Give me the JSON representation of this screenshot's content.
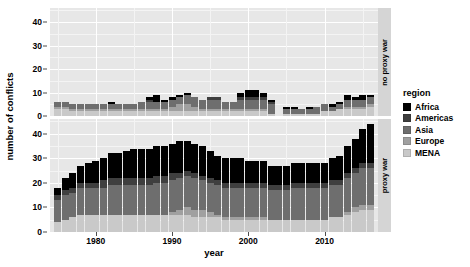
{
  "chart_data": {
    "type": "bar",
    "stacked": true,
    "title": "",
    "xlabel": "year",
    "ylabel": "number of conflicts",
    "xlim": [
      1974,
      2017
    ],
    "ylim": [
      0,
      46
    ],
    "yticks": [
      0,
      10,
      20,
      30,
      40
    ],
    "xticks": [
      1980,
      1990,
      2000,
      2010
    ],
    "grid": true,
    "legend_position": "right",
    "legend_title": "region",
    "facet_labels": [
      "no proxy war",
      "proxy war"
    ],
    "series_names": [
      "Africa",
      "Americas",
      "Asia",
      "Europe",
      "MENA"
    ],
    "series_colors": [
      "#000000",
      "#3f3f3f",
      "#6e6e6e",
      "#a0a0a0",
      "#c9c9c9"
    ],
    "panels": [
      {
        "label": "no proxy war",
        "years": [
          1975,
          1976,
          1977,
          1978,
          1979,
          1980,
          1981,
          1982,
          1983,
          1984,
          1985,
          1986,
          1987,
          1988,
          1989,
          1990,
          1991,
          1992,
          1993,
          1994,
          1995,
          1996,
          1997,
          1998,
          1999,
          2000,
          2001,
          2002,
          2003,
          2004,
          2005,
          2006,
          2007,
          2008,
          2009,
          2010,
          2011,
          2012,
          2013,
          2014,
          2015,
          2016
        ],
        "series": [
          {
            "name": "Africa",
            "values": [
              0,
              0,
              0,
              0,
              0,
              0,
              0,
              1,
              0,
              0,
              0,
              0,
              1,
              3,
              1,
              1,
              1,
              1,
              0,
              0,
              0,
              0,
              0,
              0,
              2,
              3,
              3,
              2,
              1,
              0,
              1,
              1,
              0,
              1,
              0,
              0,
              1,
              1,
              2,
              1,
              2,
              1
            ]
          },
          {
            "name": "Americas",
            "values": [
              0,
              0,
              0,
              0,
              0,
              0,
              0,
              0,
              0,
              0,
              0,
              0,
              1,
              0,
              0,
              0,
              0,
              0,
              0,
              0,
              1,
              1,
              0,
              0,
              1,
              1,
              1,
              1,
              1,
              0,
              0,
              0,
              0,
              0,
              0,
              0,
              0,
              0,
              0,
              0,
              0,
              0
            ]
          },
          {
            "name": "Asia",
            "values": [
              2,
              2,
              2,
              2,
              2,
              2,
              2,
              2,
              2,
              2,
              2,
              3,
              3,
              3,
              3,
              3,
              3,
              4,
              4,
              4,
              4,
              4,
              3,
              3,
              4,
              4,
              4,
              4,
              4,
              0,
              2,
              2,
              2,
              2,
              3,
              3,
              2,
              2,
              3,
              3,
              3,
              3
            ]
          },
          {
            "name": "Europe",
            "values": [
              1,
              1,
              1,
              1,
              1,
              1,
              1,
              1,
              1,
              1,
              1,
              1,
              1,
              1,
              1,
              2,
              3,
              3,
              2,
              1,
              1,
              1,
              1,
              1,
              1,
              1,
              1,
              1,
              0,
              0,
              0,
              0,
              0,
              0,
              0,
              0,
              0,
              0,
              1,
              1,
              1,
              1
            ]
          },
          {
            "name": "MENA",
            "values": [
              3,
              3,
              2,
              2,
              2,
              2,
              2,
              2,
              2,
              2,
              2,
              2,
              2,
              2,
              2,
              2,
              2,
              2,
              2,
              2,
              2,
              2,
              2,
              2,
              2,
              2,
              2,
              2,
              1,
              0,
              1,
              1,
              1,
              1,
              1,
              2,
              2,
              3,
              3,
              3,
              3,
              4
            ]
          }
        ],
        "totals": [
          6,
          6,
          5,
          5,
          5,
          5,
          5,
          6,
          5,
          5,
          5,
          6,
          8,
          9,
          7,
          8,
          9,
          10,
          8,
          7,
          8,
          8,
          6,
          6,
          10,
          11,
          11,
          10,
          7,
          0,
          4,
          4,
          3,
          4,
          4,
          5,
          5,
          6,
          9,
          8,
          9,
          9
        ]
      },
      {
        "label": "proxy war",
        "years": [
          1975,
          1976,
          1977,
          1978,
          1979,
          1980,
          1981,
          1982,
          1983,
          1984,
          1985,
          1986,
          1987,
          1988,
          1989,
          1990,
          1991,
          1992,
          1993,
          1994,
          1995,
          1996,
          1997,
          1998,
          1999,
          2000,
          2001,
          2002,
          2003,
          2004,
          2005,
          2006,
          2007,
          2008,
          2009,
          2010,
          2011,
          2012,
          2013,
          2014,
          2015,
          2016
        ],
        "series": [
          {
            "name": "Africa",
            "values": [
              3,
              5,
              6,
              7,
              8,
              9,
              9,
              10,
              10,
              11,
              12,
              12,
              12,
              12,
              12,
              12,
              13,
              12,
              12,
              12,
              11,
              10,
              10,
              10,
              10,
              9,
              9,
              9,
              8,
              8,
              8,
              8,
              8,
              8,
              8,
              8,
              9,
              10,
              11,
              12,
              14,
              16
            ]
          },
          {
            "name": "Americas",
            "values": [
              2,
              2,
              2,
              2,
              2,
              2,
              3,
              3,
              3,
              3,
              3,
              3,
              3,
              3,
              3,
              3,
              2,
              2,
              2,
              2,
              2,
              2,
              2,
              2,
              2,
              2,
              2,
              2,
              2,
              2,
              2,
              2,
              2,
              2,
              2,
              2,
              2,
              2,
              2,
              2,
              2,
              2
            ]
          },
          {
            "name": "Asia",
            "values": [
              9,
              10,
              10,
              11,
              11,
              11,
              11,
              12,
              12,
              12,
              12,
              12,
              12,
              13,
              13,
              13,
              13,
              13,
              13,
              12,
              12,
              12,
              12,
              12,
              12,
              12,
              12,
              12,
              12,
              12,
              12,
              13,
              13,
              13,
              13,
              13,
              13,
              13,
              14,
              14,
              15,
              15
            ]
          },
          {
            "name": "Europe",
            "values": [
              0,
              0,
              0,
              0,
              0,
              0,
              0,
              0,
              0,
              0,
              0,
              0,
              0,
              0,
              0,
              1,
              2,
              3,
              3,
              3,
              2,
              1,
              1,
              1,
              1,
              1,
              1,
              1,
              0,
              0,
              0,
              0,
              0,
              0,
              0,
              0,
              0,
              0,
              1,
              2,
              2,
              2
            ]
          },
          {
            "name": "MENA",
            "values": [
              4,
              5,
              6,
              7,
              7,
              7,
              7,
              7,
              7,
              7,
              7,
              7,
              7,
              7,
              7,
              7,
              7,
              7,
              6,
              6,
              6,
              6,
              5,
              5,
              5,
              5,
              5,
              5,
              5,
              5,
              5,
              5,
              5,
              5,
              5,
              5,
              6,
              6,
              7,
              8,
              9,
              9
            ]
          }
        ],
        "totals": [
          18,
          22,
          24,
          27,
          28,
          29,
          30,
          32,
          32,
          33,
          34,
          34,
          34,
          35,
          35,
          36,
          37,
          37,
          36,
          35,
          33,
          31,
          30,
          30,
          30,
          29,
          29,
          29,
          27,
          27,
          27,
          28,
          28,
          28,
          28,
          28,
          30,
          31,
          35,
          38,
          42,
          44
        ]
      }
    ]
  },
  "legend": {
    "title": "region",
    "items": [
      {
        "label": "Africa",
        "color": "#000000"
      },
      {
        "label": "Americas",
        "color": "#3f3f3f"
      },
      {
        "label": "Asia",
        "color": "#6e6e6e"
      },
      {
        "label": "Europe",
        "color": "#a0a0a0"
      },
      {
        "label": "MENA",
        "color": "#c9c9c9"
      }
    ]
  },
  "axes": {
    "y_title": "number of conflicts",
    "x_title": "year",
    "y_ticks": [
      "0",
      "10",
      "20",
      "30",
      "40"
    ],
    "x_ticks": [
      "1980",
      "1990",
      "2000",
      "2010"
    ]
  },
  "strips": {
    "top": "no proxy war",
    "bottom": "proxy war"
  }
}
